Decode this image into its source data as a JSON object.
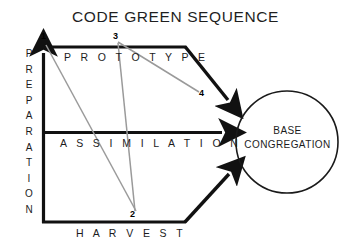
{
  "title": "CODE GREEN SEQUENCE",
  "axis": {
    "vertical_label": "PREPARATION",
    "vertical_letters": [
      "P",
      "R",
      "E",
      "P",
      "A",
      "R",
      "A",
      "T",
      "I",
      "O",
      "N"
    ]
  },
  "bands": [
    {
      "id": "prototype",
      "label": "P R O T O T Y P E"
    },
    {
      "id": "assimilation",
      "label": "A S S I M I L A T I O N"
    },
    {
      "id": "harvest",
      "label": "H A R V E S T"
    }
  ],
  "markers": [
    {
      "id": "1",
      "label": "1"
    },
    {
      "id": "2",
      "label": "2"
    },
    {
      "id": "3",
      "label": "3"
    },
    {
      "id": "4",
      "label": "4"
    }
  ],
  "target": {
    "line1": "BASE",
    "line2": "CONGREGATION"
  },
  "colors": {
    "ink": "#1a1a1a",
    "stroke": "#111111",
    "connector": "#9a9a9a",
    "background": "#ffffff"
  }
}
